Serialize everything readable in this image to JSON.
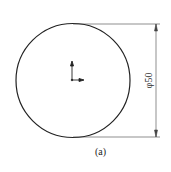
{
  "drawing": {
    "circle": {
      "cx": 73,
      "cy": 80.5,
      "r": 57
    },
    "dimension": {
      "label": "φ50",
      "x": 156,
      "y_top": 24,
      "y_bottom": 137
    },
    "origin_marker": {
      "x": 72,
      "y": 80
    }
  },
  "caption": "(a)",
  "colors": {
    "line": "#222222",
    "background": "#ffffff"
  }
}
